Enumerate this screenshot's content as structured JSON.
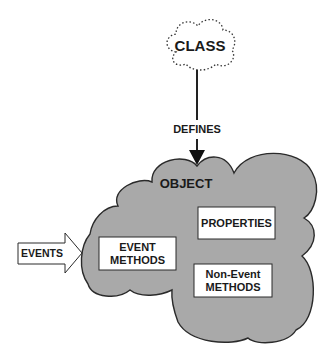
{
  "diagram": {
    "class_cloud": {
      "label": "CLASS",
      "style": "dotted-outline"
    },
    "relation": {
      "label": "DEFINES"
    },
    "object_cloud": {
      "label": "OBJECT",
      "fill": "#a9a9a9",
      "stroke": "#2a2a2a"
    },
    "boxes": {
      "properties": {
        "label": "PROPERTIES"
      },
      "event_methods": {
        "line1": "EVENT",
        "line2": "METHODS"
      },
      "non_event_methods": {
        "line1": "Non-Event",
        "line2": "METHODS"
      }
    },
    "input_arrow": {
      "label": "EVENTS"
    }
  },
  "colors": {
    "background": "#ffffff",
    "cloud_fill": "#a9a9a9",
    "outline": "#2a2a2a",
    "text": "#1a1a1a",
    "box_fill": "#ffffff"
  }
}
